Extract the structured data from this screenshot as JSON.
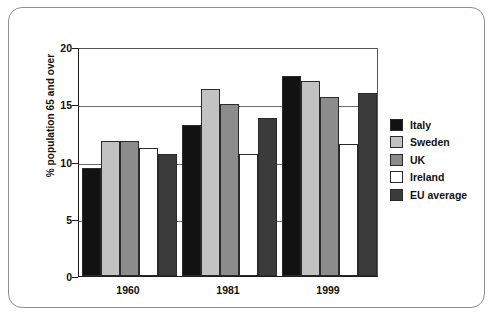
{
  "chart_data": {
    "type": "bar",
    "title": "",
    "subtitle": "",
    "xlabel": "",
    "ylabel": "% population 65 and over",
    "ylim": [
      0,
      20
    ],
    "yticks": [
      0,
      5,
      10,
      15,
      20
    ],
    "ytick_labels": [
      "0",
      "5",
      "10",
      "15",
      "20"
    ],
    "grid": true,
    "grid_axis": "y",
    "legend_position": "right",
    "categories": [
      "1960",
      "1981",
      "1999"
    ],
    "series": [
      {
        "name": "Italy",
        "color": "#121212",
        "values": [
          9.4,
          13.2,
          17.5
        ]
      },
      {
        "name": "Sweden",
        "color": "#c2c2c2",
        "values": [
          11.8,
          16.3,
          17.0
        ]
      },
      {
        "name": "UK",
        "color": "#8c8c8c",
        "values": [
          11.8,
          15.0,
          15.6
        ]
      },
      {
        "name": "Ireland",
        "color": "#ffffff",
        "values": [
          11.2,
          10.7,
          11.5
        ]
      },
      {
        "name": "EU average",
        "color": "#3b3b3b",
        "values": [
          10.7,
          13.8,
          16.0
        ]
      }
    ]
  },
  "legend": {
    "items": [
      {
        "label": "Italy"
      },
      {
        "label": "Sweden"
      },
      {
        "label": "UK"
      },
      {
        "label": "Ireland"
      },
      {
        "label": "EU average"
      }
    ]
  },
  "axes": {
    "y_title": "% population 65 and over",
    "y_tick_labels": [
      "20",
      "15",
      "10",
      "5",
      "0"
    ],
    "x_tick_labels": [
      "1960",
      "1981",
      "1999"
    ]
  },
  "style": {
    "frame_border": "#8f8f93",
    "axis_color": "#1d1d1d",
    "gridline_color": "#6b6b6b",
    "background": "#ffffff"
  }
}
